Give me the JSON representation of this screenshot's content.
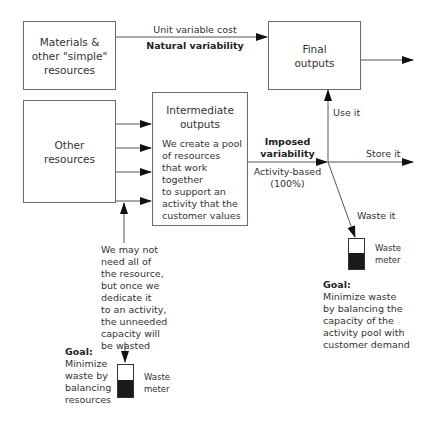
{
  "boxes": {
    "materials": {
      "label_lines": [
        "Materials &",
        "other \"simple\"",
        "resources"
      ]
    },
    "final_outputs": {
      "label_lines": [
        "Final",
        "outputs"
      ]
    },
    "other_resources": {
      "label_lines": [
        "Other",
        "resources"
      ]
    },
    "intermediate_outputs": {
      "title_lines": [
        "Intermediate",
        "outputs"
      ],
      "body_lines": [
        "We create a pool",
        "of resources",
        "that work together",
        "to support an",
        "activity that the",
        "customer values"
      ]
    }
  },
  "edges": {
    "top": {
      "label": "Unit variable cost",
      "bold_label": "Natural variability"
    },
    "imposed": {
      "bold_lines": [
        "Imposed",
        "variability"
      ],
      "sub_lines": [
        "Activity-based",
        "(100%)"
      ]
    },
    "use_it": "Use it",
    "store_it": "Store it",
    "waste_it": "Waste it"
  },
  "left_note": {
    "lines": [
      "We may not",
      "need all of",
      "the resource,",
      "but once we",
      "dedicate it",
      "to an activity,",
      "the unneeded",
      "capacity will",
      "be wasted"
    ]
  },
  "left_goal": {
    "heading": "Goal:",
    "lines": [
      "Minimize",
      "waste by",
      "balancing",
      "resources"
    ]
  },
  "right_goal": {
    "heading": "Goal:",
    "lines": [
      "Minimize waste",
      "by balancing the",
      "capacity of the",
      "activity pool with",
      "customer demand"
    ]
  },
  "waste_meter_label_lines": [
    "Waste",
    "meter"
  ],
  "colors": {
    "line": "#5a5a5a",
    "arrowhead": "#111111",
    "meter_fill": "#1a1a1a"
  }
}
